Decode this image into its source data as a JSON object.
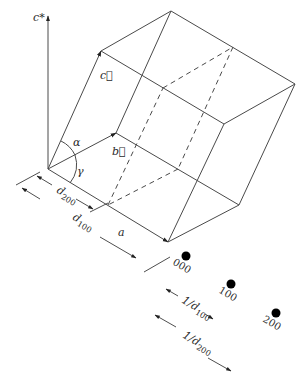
{
  "diagram": {
    "type": "crystal unit cell with lattice planes and reciprocal lattice points",
    "colors": {
      "line": "#4a4a4a",
      "text": "#2a2a2a",
      "dot": "#000000",
      "background": "#ffffff"
    },
    "axes": {
      "c_star": "c*",
      "a": "a",
      "b_vec": "b⃗",
      "c_vec": "c⃗"
    },
    "angles": {
      "alpha": "α",
      "gamma": "γ"
    },
    "dimensions": {
      "d200": {
        "base": "d",
        "sub": "200"
      },
      "d100": {
        "base": "d",
        "sub": "100"
      },
      "a_len": "a"
    },
    "reciprocal_points": [
      {
        "label": "000"
      },
      {
        "label": "100"
      },
      {
        "label": "200"
      }
    ],
    "reciprocal_spacings": {
      "inv_d100": {
        "base": "1/d",
        "sub": "100"
      },
      "inv_d200": {
        "base": "1/d",
        "sub": "200"
      }
    }
  }
}
